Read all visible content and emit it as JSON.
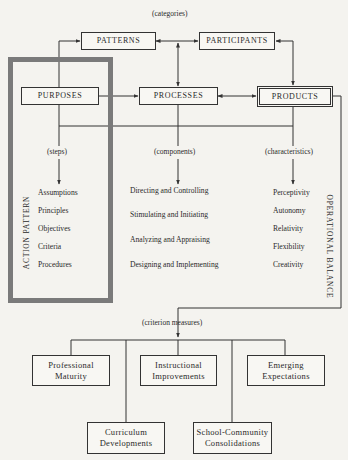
{
  "diagram": {
    "categories_label": "(categories)",
    "categories": {
      "patterns": "PATTERNS",
      "participants": "PARTICIPANTS",
      "purposes": "PURPOSES",
      "processes": "PROCESSES",
      "products": "PRODUCTS"
    },
    "sub_labels": {
      "steps": "(steps)",
      "components": "(components)",
      "characteristics": "(characteristics)",
      "criterion_measures": "(criterion measures)"
    },
    "steps": [
      "Assumptions",
      "Principles",
      "Objectives",
      "Criteria",
      "Procedures"
    ],
    "components": [
      "Directing and Controlling",
      "Stimulating and Initiating",
      "Analyzing and Appraising",
      "Designing and Implementing"
    ],
    "characteristics": [
      "Perceptivity",
      "Autonomy",
      "Relativity",
      "Flexibility",
      "Creativity"
    ],
    "side_labels": {
      "left": "ACTION PATTERN",
      "right": "OPERATIONAL BALANCE"
    },
    "criterion_measures": [
      {
        "line1": "Professional",
        "line2": "Maturity"
      },
      {
        "line1": "Instructional",
        "line2": "Improvements"
      },
      {
        "line1": "Emerging",
        "line2": "Expectations"
      },
      {
        "line1": "Curriculum",
        "line2": "Developments"
      },
      {
        "line1": "School-Community",
        "line2": "Consolidations"
      }
    ],
    "colors": {
      "frame": "#7a7a7a",
      "line": "#333333",
      "background": "#f4f3ef"
    }
  }
}
